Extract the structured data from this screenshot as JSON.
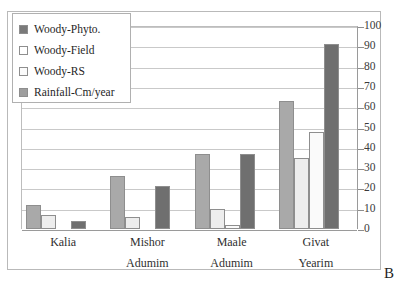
{
  "figure": {
    "panel_letter": "B",
    "background_color": "#ffffff",
    "frame_color": "#b9b9b9"
  },
  "legend": {
    "position": "top-left",
    "items": [
      {
        "label": "Woody-Phyto.",
        "color": "#7a7a7a"
      },
      {
        "label": "Woody-Field",
        "color": "#ffffff"
      },
      {
        "label": "Woody-RS",
        "color": "#fbfbfb"
      },
      {
        "label": "Rainfall-Cm/year",
        "color": "#9e9e9e"
      }
    ]
  },
  "yaxis": {
    "side": "right",
    "min": 0,
    "max": 100,
    "step": 10,
    "ticks": [
      "0",
      "10",
      "20",
      "30",
      "40",
      "50",
      "60",
      "70",
      "80",
      "90",
      "100"
    ]
  },
  "xaxis": {
    "categories": [
      {
        "line1": "Kalia",
        "line2": ""
      },
      {
        "line1": "Mishor",
        "line2": "Adumim"
      },
      {
        "line1": "Maale",
        "line2": "Adumim"
      },
      {
        "line1": "Givat",
        "line2": "Yearim"
      }
    ]
  },
  "chart_data": {
    "type": "bar",
    "title": "",
    "subtitle": "",
    "xlabel": "",
    "ylabel": "",
    "ylim": [
      0,
      100
    ],
    "ytick_step": 10,
    "grid": true,
    "legend_position": "top-left",
    "axis_side": "right",
    "panel_label": "B",
    "categories": [
      "Kalia",
      "Mishor Adumim",
      "Maale Adumim",
      "Givat Yearim"
    ],
    "series": [
      {
        "name": "Woody-Phyto.",
        "color": "#a9a9a9",
        "values": [
          12,
          26,
          37,
          63
        ]
      },
      {
        "name": "Woody-Field",
        "color": "#ededed",
        "values": [
          7,
          6,
          10,
          35
        ]
      },
      {
        "name": "Woody-RS",
        "color": "#fafafa",
        "values": [
          0,
          0,
          2,
          48
        ]
      },
      {
        "name": "Rainfall-Cm/year",
        "color": "#6f6f6f",
        "values": [
          4,
          21,
          37,
          91
        ]
      }
    ]
  }
}
